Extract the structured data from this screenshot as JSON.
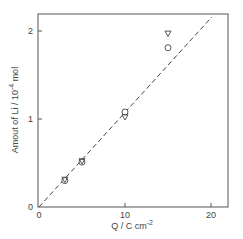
{
  "chart_data": {
    "type": "scatter",
    "title": "",
    "xlabel": "Q / C cm",
    "xlabel_sup": "-2",
    "ylabel": "Amout of Li / 10",
    "ylabel_sup": "-4",
    "ylabel_unit": " mol",
    "xlim": [
      0,
      22
    ],
    "ylim": [
      0,
      2.2
    ],
    "xticks": [
      0,
      10,
      20
    ],
    "yticks": [
      0,
      1,
      2
    ],
    "xtick_labels": [
      "0",
      "10",
      "20"
    ],
    "ytick_labels": [
      "0",
      "1",
      "2"
    ],
    "grid": false,
    "legend": "none",
    "series": [
      {
        "name": "circle",
        "marker": "o",
        "x": [
          3,
          5,
          10,
          15
        ],
        "y": [
          0.3,
          0.51,
          1.08,
          1.81
        ]
      },
      {
        "name": "triangle",
        "marker": "v",
        "x": [
          3,
          5,
          10,
          15
        ],
        "y": [
          0.31,
          0.52,
          1.02,
          1.97
        ]
      },
      {
        "name": "theoretical",
        "style": "dashed-line",
        "x": [
          0,
          20.1
        ],
        "y": [
          0,
          2.16
        ]
      }
    ]
  }
}
